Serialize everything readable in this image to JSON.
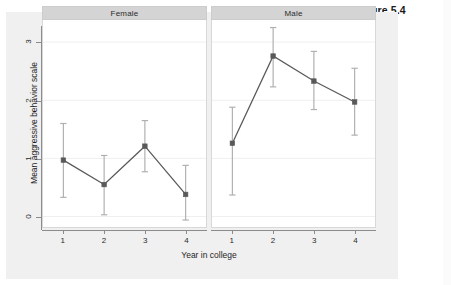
{
  "figure": {
    "caption": "Figure 5.4"
  },
  "chart_data": {
    "type": "line",
    "title": "Figure 5.4",
    "xlabel": "Year in college",
    "ylabel": "Mean aggressive behavior scale",
    "x": [
      1,
      2,
      3,
      4
    ],
    "xtick_labels": [
      "1",
      "2",
      "3",
      "4"
    ],
    "ytick_labels": [
      "0",
      "1",
      "2",
      "3"
    ],
    "yticks": [
      0,
      1,
      2,
      3
    ],
    "ylim": [
      -0.18,
      3.38
    ],
    "xlim": [
      0.5,
      4.5
    ],
    "grid": "horizontal",
    "legend_position": "none",
    "facet_variable": "Sex",
    "error_bars": "95% confidence interval",
    "panels": [
      {
        "label": "Female",
        "series": [
          {
            "name": "Female",
            "values": [
              0.97,
              0.55,
              1.21,
              0.38
            ],
            "err_low": [
              0.33,
              0.03,
              0.77,
              -0.06
            ],
            "err_high": [
              1.6,
              1.05,
              1.65,
              0.88
            ]
          }
        ]
      },
      {
        "label": "Male",
        "series": [
          {
            "name": "Male",
            "values": [
              1.26,
              2.76,
              2.33,
              1.97
            ],
            "err_low": [
              0.37,
              2.23,
              1.84,
              1.4
            ],
            "err_high": [
              1.88,
              3.25,
              2.84,
              2.55
            ]
          }
        ]
      }
    ],
    "colors": {
      "marker": "#595959",
      "line": "#5a5a5a",
      "error_bar": "#b0b0b0",
      "gridline": "#efefef",
      "panel_background": "#ffffff",
      "strip_background": "#d4d4d4",
      "canvas_background": "#f0f0f0",
      "axis": "#8c8c8c"
    }
  }
}
